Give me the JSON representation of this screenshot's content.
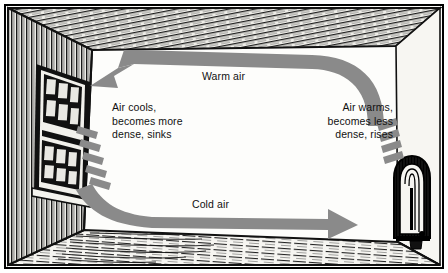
{
  "diagram": {
    "type": "illustration",
    "scene": "room-interior-cross-section",
    "style": "pen-and-ink engraving",
    "colors": {
      "arrow_gray": "#8a8a8a",
      "ink_black": "#111111",
      "paper": "#fdfdfb",
      "wall_light": "#f4f3f0"
    },
    "labels": {
      "warm_air": "Warm air",
      "cold_air": "Cold air",
      "left_note": "Air cools,\nbecomes more\ndense, sinks",
      "right_note": "Air warms,\nbecomes less\ndense, rises"
    },
    "objects": [
      {
        "name": "window",
        "wall": "left",
        "panes_per_sash": 6,
        "sashes": 2
      },
      {
        "name": "radiator",
        "wall": "right",
        "fins": "vertical"
      },
      {
        "name": "floor",
        "material": "wood planks"
      },
      {
        "name": "ceiling",
        "material": "wood planks"
      }
    ],
    "flow": {
      "loop_direction": "counter-clockwise",
      "top_stream": {
        "label": "Warm air",
        "direction": "right-to-left",
        "arrowhead": "left"
      },
      "bottom_stream": {
        "label": "Cold air",
        "direction": "left-to-right",
        "arrowhead": "right"
      },
      "rise_at": "radiator",
      "fall_at": "window"
    }
  }
}
